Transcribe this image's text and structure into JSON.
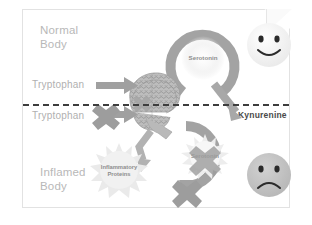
{
  "diagram": {
    "sections": {
      "top_label_line1": "Normal",
      "top_label_line2": "Body",
      "bottom_label_line1": "Inflamed",
      "bottom_label_line2": "Body"
    },
    "labels": {
      "tryptophan_normal": "Tryptophan",
      "tryptophan_inflamed": "Tryptophan",
      "serotonin_normal": "Serotonin",
      "serotonin_inflamed": "Serotonin",
      "kynurenine": "Kynurenine",
      "inflammatory_proteins_line1": "Inflammatory",
      "inflammatory_proteins_line2": "Proteins"
    },
    "icons": {
      "brain": "brain-icon",
      "happy_face": "happy-face-icon",
      "sad_face": "sad-face-icon",
      "arrow_right_normal": "right-arrow-icon",
      "arrow_right_blocked": "blocked-right-arrow-icon",
      "cycle_arrow_normal": "circular-arrow-icon",
      "cycle_arrow_inflamed": "circular-arrow-icon",
      "blocked_cross_top": "cross-block-icon",
      "blocked_cross_serotonin": "cross-block-icon",
      "blocked_cross_cycle": "cross-block-icon",
      "arrow_to_proteins": "bent-arrow-icon",
      "arrow_to_kynurenine": "diagonal-arrow-icon",
      "starburst_proteins": "starburst-icon",
      "glow_serotonin": "glow-icon"
    },
    "colors": {
      "page_background": "#ffffff",
      "card_background": "#ffffff",
      "card_border": "#e2e2e2",
      "label_gray": "#b3b3b3",
      "arrow_gray": "#9a9a9a",
      "cycle_gray": "#9d9d9d",
      "divider_dark": "#3d3d3d",
      "brain_gray": "#b5b5b5",
      "happy_face": "#f2f2f2",
      "sad_face": "#c2c2c2",
      "face_feature": "#2b2b2b",
      "starburst": "#e8e8e8",
      "cross_gray": "#a0a0a0",
      "micro_text": "#8d8d8d"
    }
  }
}
